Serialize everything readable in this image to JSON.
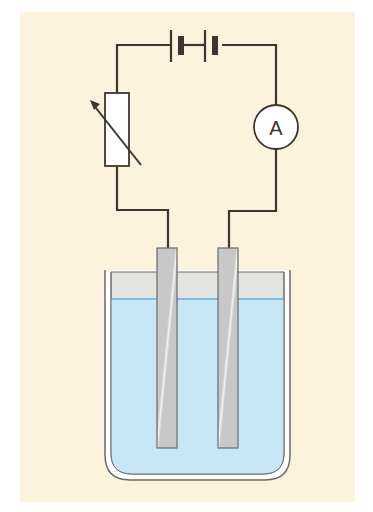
{
  "diagram": {
    "components": {
      "battery": {
        "label": "",
        "cells": 2,
        "icon": "battery-icon"
      },
      "variable_resistor": {
        "label": "",
        "icon": "variable-resistor-icon"
      },
      "ammeter": {
        "label": "A",
        "icon": "ammeter-icon"
      },
      "electrodes": {
        "count": 2,
        "icon": "electrode-icon"
      },
      "beaker": {
        "label": "",
        "icon": "beaker-icon"
      },
      "electrolyte": {
        "label": ""
      }
    },
    "colors": {
      "background": "#fcf3dd",
      "wire": "#3d3530",
      "liquid": "#c6e6f5",
      "liquid_surface": "#7fbde0",
      "air_in_beaker": "#e3e3e0",
      "electrode": "#cfcfcf",
      "beaker_outline": "#6a6a6a",
      "resistor_fill": "#ffffff"
    }
  }
}
